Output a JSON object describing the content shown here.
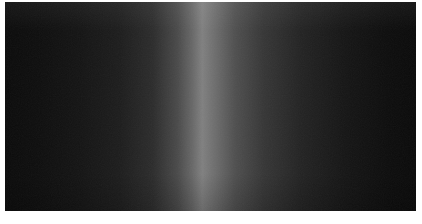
{
  "page": {
    "background_color": "#ffffff"
  },
  "photo": {
    "description": "dark photograph filled edge-to-edge with a dim field and a soft bright vertical band of light slightly left of center",
    "base_color": "#0a0a0a",
    "band": {
      "center_position_percent": 48,
      "peak_color": "#808080",
      "left_edge_color": "#0b0b0b",
      "right_edge_color": "#0a0a0a"
    },
    "gradient_stops": [
      {
        "position": 0,
        "color": "#0b0b0b"
      },
      {
        "position": 8,
        "color": "#0e0e0e"
      },
      {
        "position": 18,
        "color": "#141414"
      },
      {
        "position": 28,
        "color": "#1d1d1d"
      },
      {
        "position": 36,
        "color": "#2c2c2c"
      },
      {
        "position": 42,
        "color": "#4a4a4a"
      },
      {
        "position": 45.5,
        "color": "#676767"
      },
      {
        "position": 48,
        "color": "#808080"
      },
      {
        "position": 51,
        "color": "#6e6e6e"
      },
      {
        "position": 56,
        "color": "#4f4f4f"
      },
      {
        "position": 63,
        "color": "#363636"
      },
      {
        "position": 72,
        "color": "#232323"
      },
      {
        "position": 83,
        "color": "#151515"
      },
      {
        "position": 93,
        "color": "#0d0d0d"
      },
      {
        "position": 100,
        "color": "#0a0a0a"
      }
    ],
    "grain_opacity": 0.05
  }
}
